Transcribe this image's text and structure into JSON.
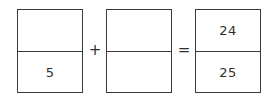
{
  "equation": {
    "type": "fraction-addition",
    "colors": {
      "background": "#ffffff",
      "border": "#3a3a3a",
      "text": "#2e2e2e"
    },
    "terms": [
      {
        "name": "first-fraction",
        "numerator": "",
        "denominator": "5"
      },
      {
        "name": "second-fraction",
        "numerator": "",
        "denominator": ""
      },
      {
        "name": "result-fraction",
        "numerator": "24",
        "denominator": "25"
      }
    ],
    "operators": {
      "plus": "+",
      "equals": "="
    }
  }
}
